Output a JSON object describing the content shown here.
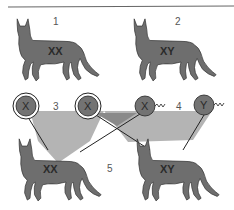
{
  "diagram": {
    "colors": {
      "cat": "#6e6e6e",
      "cat_outline": "#333333",
      "gamete": "#737373",
      "light_region": "#b4b4b4",
      "dark_region": "#8a8a8a",
      "rule": "#666666"
    },
    "parents": [
      {
        "label": "1",
        "chromosomes": "XX",
        "sex": "female"
      },
      {
        "label": "2",
        "chromosomes": "XY",
        "sex": "male"
      }
    ],
    "gametes": {
      "maternal": {
        "label": "3",
        "items": [
          "X",
          "X"
        ]
      },
      "paternal": {
        "label": "4",
        "items": [
          "X",
          "Y"
        ]
      }
    },
    "offspring": {
      "label": "5",
      "items": [
        {
          "chromosomes": "XX"
        },
        {
          "chromosomes": "XY"
        }
      ]
    }
  }
}
